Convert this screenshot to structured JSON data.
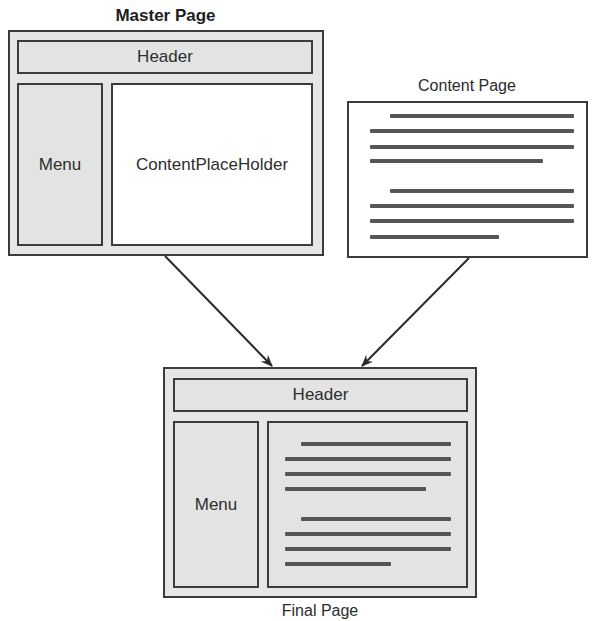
{
  "master_page": {
    "title": "Master Page",
    "header_label": "Header",
    "menu_label": "Menu",
    "content_label": "ContentPlaceHolder"
  },
  "content_page": {
    "title": "Content Page",
    "paragraphs": [
      {
        "lines": [
          {
            "indent": true,
            "length": "full"
          },
          {
            "indent": false,
            "length": "full"
          },
          {
            "indent": false,
            "length": "full"
          },
          {
            "indent": false,
            "length": "short"
          }
        ]
      },
      {
        "lines": [
          {
            "indent": true,
            "length": "full"
          },
          {
            "indent": false,
            "length": "full"
          },
          {
            "indent": false,
            "length": "full"
          },
          {
            "indent": false,
            "length": "shorter"
          }
        ]
      }
    ]
  },
  "final_page": {
    "title": "Final Page",
    "header_label": "Header",
    "menu_label": "Menu"
  },
  "arrows": [
    {
      "from": "master_page",
      "to": "final_page"
    },
    {
      "from": "content_page",
      "to": "final_page"
    }
  ],
  "colors": {
    "frame_fill": "#e6e6e6",
    "border": "#3c3c3c",
    "text_line": "#555555",
    "white_panel": "#ffffff"
  }
}
